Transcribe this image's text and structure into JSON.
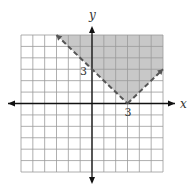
{
  "chart_data": {
    "type": "area",
    "title": "",
    "xlabel": "x",
    "ylabel": "y",
    "xlim": [
      -6,
      6
    ],
    "ylim": [
      -6,
      6
    ],
    "grid": true,
    "grid_step": 1,
    "boundary": {
      "style": "dashed",
      "vertex": [
        3,
        0
      ],
      "points": [
        [
          -3,
          6
        ],
        [
          3,
          0
        ],
        [
          6,
          3
        ]
      ],
      "arrows": true
    },
    "shaded_region": {
      "polygon": [
        [
          -3,
          6
        ],
        [
          3,
          0
        ],
        [
          6,
          3
        ],
        [
          6,
          6
        ]
      ],
      "color": "#c8c8c8"
    },
    "annotations": [
      {
        "text": "3",
        "at": [
          0,
          3
        ],
        "position": "left"
      },
      {
        "text": "3",
        "at": [
          3,
          0
        ],
        "position": "below"
      }
    ]
  },
  "colors": {
    "grid": "#9a9a9a",
    "axis": "#111111",
    "boundary": "#555555",
    "shade": "#c8c8c8"
  }
}
